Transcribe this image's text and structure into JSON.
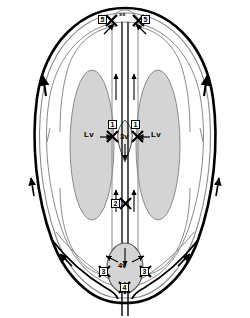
{
  "figure": {
    "type": "medical-schematic"
  },
  "colors": {
    "outline": "#000000",
    "inner_line": "#8a8a8a",
    "ventricle_fill": "#d4d4d4",
    "ventricle_stroke": "#8a8a8a",
    "background": "#ffffff",
    "box_border": "#000000",
    "text": "#000000"
  },
  "anatomy_labels": [
    {
      "id": "lv-left",
      "text": "Lv",
      "x": 84,
      "y": 135
    },
    {
      "id": "lv-right",
      "text": "Lv",
      "x": 151,
      "y": 135
    },
    {
      "id": "third-ventricle",
      "text": "3v",
      "x": 120,
      "y": 135
    },
    {
      "id": "fourth-ventricle",
      "text": "4v",
      "x": 118,
      "y": 270
    },
    {
      "id": "sagittal-sinus",
      "text": "ss",
      "x": 119,
      "y": 14
    }
  ],
  "obstruction_sites": [
    {
      "id": "site-1-left",
      "label": "1",
      "x": 108,
      "y": 122
    },
    {
      "id": "site-1-right",
      "label": "1",
      "x": 131,
      "y": 122
    },
    {
      "id": "site-2",
      "label": "2",
      "x": 111,
      "y": 202
    },
    {
      "id": "site-3-left",
      "label": "3",
      "x": 102,
      "y": 272
    },
    {
      "id": "site-3-right",
      "label": "3",
      "x": 138,
      "y": 272
    },
    {
      "id": "site-4",
      "label": "4",
      "x": 124,
      "y": 287
    },
    {
      "id": "site-5-left",
      "label": "5",
      "x": 101,
      "y": 20
    },
    {
      "id": "site-5-right",
      "label": "5",
      "x": 137,
      "y": 20
    }
  ],
  "legend_note": {
    "x_marks": "X marks indicate sites of CSF flow obstruction",
    "arrows": "Arrows indicate direction of CSF flow"
  }
}
